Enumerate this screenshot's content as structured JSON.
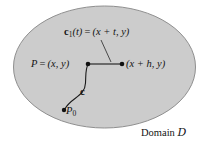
{
  "figure": {
    "background_color": "#ffffff",
    "domain": {
      "shape": "ellipse",
      "fill_color": "#cccccc",
      "stroke_color": "#8c8c8c",
      "caption": "Domain",
      "caption_symbol": "D"
    },
    "labels": {
      "c1_curve": {
        "vector": "c",
        "subscript": "1",
        "argument": "(t)",
        "equals": "=",
        "value": "(x + t, y)",
        "full_text": "c1(t) = (x + t, y)"
      },
      "point_p": {
        "name": "P",
        "equals": "=",
        "value": "(x, y)",
        "full_text": "P = (x, y)"
      },
      "point_right": {
        "value": "(x + h, y)",
        "full_text": "(x + h, y)"
      },
      "curve_c": {
        "vector": "c",
        "full_text": "c"
      },
      "point_p0": {
        "name": "P",
        "subscript": "0",
        "full_text": "P0"
      },
      "domain_caption": {
        "word": "Domain",
        "symbol": "D",
        "full_text": "Domain D"
      }
    },
    "points": [
      {
        "name": "P",
        "x": 88,
        "y": 64
      },
      {
        "name": "x+h,y",
        "x": 122,
        "y": 64
      },
      {
        "name": "P0",
        "x": 64,
        "y": 110
      }
    ],
    "segments": [
      {
        "name": "horizontal-segment",
        "from": [
          88,
          64
        ],
        "to": [
          122,
          64
        ]
      },
      {
        "name": "leader-line-c1",
        "from": [
          101,
          40
        ],
        "to": [
          111,
          62
        ]
      }
    ],
    "curve_path": "M 64 110 C 70 96 84 96 85 82 C 86 72 86 68 88 64"
  }
}
